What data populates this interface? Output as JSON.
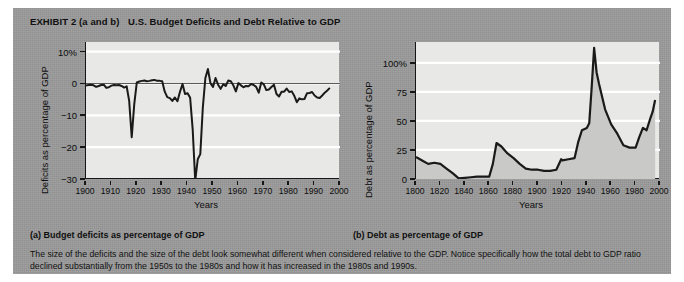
{
  "exhibit": {
    "label": "EXHIBIT 2 (a and b)",
    "title": "U.S. Budget Deficits and Debt Relative to GDP",
    "caption_a": "(a) Budget deficits as percentage of GDP",
    "caption_b": "(b) Debt as percentage of GDP",
    "note": "The size of the deficits and the size of the debt look somewhat different when considered relative to the GDP. Notice specifically how the total debt to GDP ratio declined substantially from the 1950s to the 1980s and how it has increased in the 1980s and 1990s.",
    "panel_bg": "#9a9a9a",
    "plot_bg": "#e8e8e6",
    "line_color": "#1a1a1a",
    "grid_color": "#ffffff"
  },
  "chart_data": [
    {
      "type": "line",
      "title": "(a) Budget deficits as percentage of GDP",
      "xlabel": "Years",
      "ylabel": "Deficits as percentage of GDP",
      "xlim": [
        1900,
        2000
      ],
      "ylim": [
        -30,
        13
      ],
      "yticks": [
        10,
        0,
        -10,
        -20,
        -30
      ],
      "ytick_labels": [
        "10%",
        "0",
        "−10",
        "−20",
        "−30"
      ],
      "xticks": [
        1900,
        1910,
        1920,
        1930,
        1940,
        1950,
        1960,
        1970,
        1980,
        1990,
        2000
      ],
      "xtick_labels": [
        "1900",
        "1910",
        "1920",
        "1930",
        "1940",
        "1950",
        "1960",
        "1970",
        "1980",
        "1990",
        "2000"
      ],
      "grid": true,
      "legend": "none",
      "x": [
        1900,
        1901,
        1902,
        1903,
        1904,
        1905,
        1906,
        1907,
        1908,
        1909,
        1910,
        1911,
        1912,
        1913,
        1914,
        1915,
        1916,
        1917,
        1918,
        1919,
        1920,
        1921,
        1922,
        1923,
        1924,
        1925,
        1926,
        1927,
        1928,
        1929,
        1930,
        1931,
        1932,
        1933,
        1934,
        1935,
        1936,
        1937,
        1938,
        1939,
        1940,
        1941,
        1942,
        1943,
        1944,
        1945,
        1946,
        1947,
        1948,
        1949,
        1950,
        1951,
        1952,
        1953,
        1954,
        1955,
        1956,
        1957,
        1958,
        1959,
        1960,
        1961,
        1962,
        1963,
        1964,
        1965,
        1966,
        1967,
        1968,
        1969,
        1970,
        1971,
        1972,
        1973,
        1974,
        1975,
        1976,
        1977,
        1978,
        1979,
        1980,
        1981,
        1982,
        1983,
        1984,
        1985,
        1986,
        1987,
        1988,
        1989,
        1990,
        1991,
        1992,
        1993,
        1994,
        1995,
        1996
      ],
      "values": [
        -0.7,
        -0.5,
        -0.4,
        -0.6,
        -1.1,
        -0.8,
        -0.5,
        -0.4,
        -1.4,
        -1.2,
        -0.7,
        -0.5,
        -0.6,
        -0.5,
        -0.8,
        -1.3,
        -0.9,
        -5.5,
        -16.9,
        -6.5,
        0.3,
        0.6,
        0.8,
        0.9,
        0.7,
        0.8,
        1.0,
        1.1,
        0.8,
        0.8,
        0.7,
        -2.6,
        -4.3,
        -4.6,
        -5.5,
        -4.4,
        -5.6,
        -2.6,
        -0.2,
        -3.3,
        -3.1,
        -4.5,
        -14.4,
        -30.5,
        -23.8,
        -22.2,
        -7.5,
        1.7,
        4.5,
        0.1,
        -1.1,
        1.7,
        -0.4,
        -1.7,
        -0.3,
        -0.8,
        0.9,
        0.7,
        -0.6,
        -2.5,
        0.1,
        -0.6,
        -1.2,
        -0.8,
        -0.9,
        -0.2,
        -0.5,
        -1.1,
        -2.9,
        0.3,
        -0.3,
        -2.1,
        -1.9,
        -1.1,
        -0.4,
        -3.3,
        -4.1,
        -2.6,
        -2.6,
        -1.6,
        -2.7,
        -2.5,
        -3.9,
        -5.9,
        -4.7,
        -5.0,
        -4.9,
        -3.1,
        -3.0,
        -2.7,
        -3.8,
        -4.4,
        -4.6,
        -3.8,
        -2.9,
        -2.2,
        -1.4
      ]
    },
    {
      "type": "line",
      "title": "(b) Debt as percentage of GDP",
      "xlabel": "Years",
      "ylabel": "Debt as percentage of GDP",
      "xlim": [
        1800,
        2000
      ],
      "ylim": [
        0,
        118
      ],
      "yticks": [
        100,
        75,
        50,
        25,
        0
      ],
      "ytick_labels": [
        "100%",
        "75",
        "50",
        "25",
        "0"
      ],
      "xticks": [
        1800,
        1820,
        1840,
        1860,
        1880,
        1900,
        1920,
        1940,
        1960,
        1980,
        2000
      ],
      "xtick_labels": [
        "1800",
        "1820",
        "1840",
        "1860",
        "1880",
        "1900",
        "1920",
        "1940",
        "1960",
        "1980",
        "2000"
      ],
      "grid": true,
      "legend": "none",
      "x": [
        1800,
        1805,
        1810,
        1815,
        1820,
        1825,
        1830,
        1835,
        1840,
        1845,
        1850,
        1855,
        1860,
        1863,
        1866,
        1870,
        1875,
        1880,
        1885,
        1890,
        1895,
        1900,
        1905,
        1910,
        1915,
        1919,
        1920,
        1925,
        1930,
        1933,
        1936,
        1940,
        1942,
        1944,
        1946,
        1948,
        1950,
        1955,
        1960,
        1965,
        1970,
        1975,
        1980,
        1983,
        1986,
        1989,
        1992,
        1994,
        1996
      ],
      "values": [
        19,
        16,
        13,
        14,
        13,
        9,
        5,
        0.5,
        1,
        1.5,
        2,
        2,
        2,
        13,
        31,
        28,
        22,
        18,
        13,
        9,
        8,
        8,
        7,
        7,
        8,
        17,
        16,
        17,
        18,
        32,
        42,
        44,
        48,
        79,
        113,
        92,
        82,
        60,
        47,
        39,
        29,
        27,
        27,
        36,
        44,
        42,
        52,
        58,
        68
      ]
    }
  ]
}
